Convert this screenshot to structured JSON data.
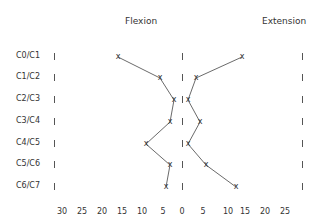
{
  "chart_data": {
    "type": "scatter",
    "title": "",
    "panel_titles": {
      "left": "Flexion",
      "right": "Extension"
    },
    "categories": [
      "C0/C1",
      "C1/C2",
      "C2/C3",
      "C3/C4",
      "C4/C5",
      "C5/C6",
      "C6/C7"
    ],
    "x_tick_labels": [
      "30",
      "25",
      "20",
      "15",
      "10",
      "5",
      "0",
      "5",
      "10",
      "15",
      "20",
      "25"
    ],
    "series": [
      {
        "name": "Flexion",
        "marker": "x",
        "values": [
          16,
          5.5,
          2,
          3,
          9,
          3,
          4
        ]
      },
      {
        "name": "Extension",
        "marker": "x",
        "values": [
          15,
          3.5,
          1.5,
          4.5,
          1.5,
          6,
          13.5
        ]
      }
    ],
    "xlabel": "",
    "ylabel": "",
    "xlim": [
      -30,
      30
    ],
    "grid": false,
    "legend": "none"
  }
}
